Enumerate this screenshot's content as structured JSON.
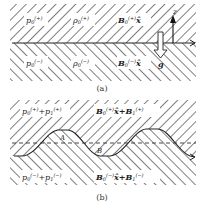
{
  "figure": {
    "panel_a": {
      "caption": "(a)",
      "upper_region": {
        "pressure_label": "p0(+)",
        "density_label": "ρ0(+)",
        "field_label": "B0(+)x̂"
      },
      "lower_region": {
        "pressure_label": "p0(−)",
        "density_label": "ρ0(−)",
        "field_label": "B0(−)x̂"
      },
      "axis_label": "z",
      "gravity_label": "g"
    },
    "panel_b": {
      "caption": "(b)",
      "upper_region": {
        "pressure_label": "p0(+)+p1(+)",
        "field_label": "B0(+)x̂+B1(+)"
      },
      "lower_region": {
        "pressure_label": "p0(−)+p1(−)",
        "field_label": "B0(−)x̂+B1(−)"
      },
      "point_a_label": "A",
      "point_b_label": "B"
    },
    "colors": {
      "hatch": "#2a2a2a",
      "background": "#ffffff",
      "text": "#222222"
    }
  }
}
